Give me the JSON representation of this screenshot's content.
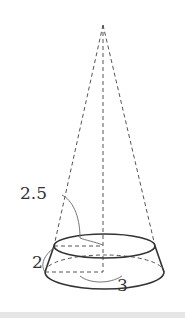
{
  "diagram": {
    "type": "frustum-of-cone",
    "labels": {
      "slant_height": "2",
      "top_radius": "2.5",
      "bottom_radius": "3"
    },
    "colors": {
      "stroke": "#333333",
      "dashed": "#555555",
      "background": "#ffffff"
    }
  }
}
